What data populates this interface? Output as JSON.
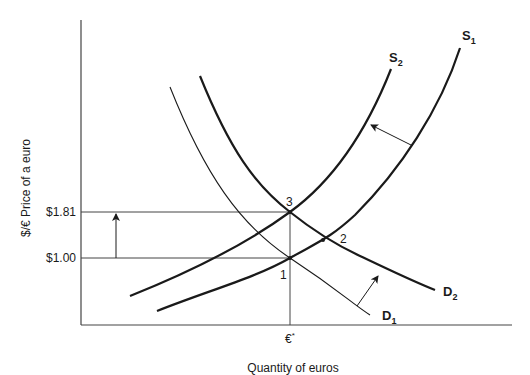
{
  "diagram": {
    "type": "supply-demand",
    "y_axis_label": "$/€  Price of a euro",
    "x_axis_label": "Quantity of euros",
    "y_ticks": [
      {
        "label": "$1.81",
        "value": 1.81
      },
      {
        "label": "$1.00",
        "value": 1.0
      }
    ],
    "x_ticks": [
      {
        "label": "€",
        "sup": "*"
      }
    ],
    "curves": [
      {
        "id": "S1",
        "base": "S",
        "sub": "1",
        "kind": "supply"
      },
      {
        "id": "S2",
        "base": "S",
        "sub": "2",
        "kind": "supply"
      },
      {
        "id": "D1",
        "base": "D",
        "sub": "1",
        "kind": "demand"
      },
      {
        "id": "D2",
        "base": "D",
        "sub": "2",
        "kind": "demand"
      }
    ],
    "points": [
      {
        "label": "1",
        "desc": "S1 ∩ D1 at $1.00"
      },
      {
        "label": "2",
        "desc": "S1 ∩ D2"
      },
      {
        "label": "3",
        "desc": "S2 ∩ D2 at $1.81"
      }
    ],
    "shifts": [
      {
        "from": "S1",
        "to": "S2",
        "direction": "left"
      },
      {
        "from": "D1",
        "to": "D2",
        "direction": "right"
      },
      {
        "from": "$1.00",
        "to": "$1.81",
        "direction": "up"
      }
    ]
  }
}
